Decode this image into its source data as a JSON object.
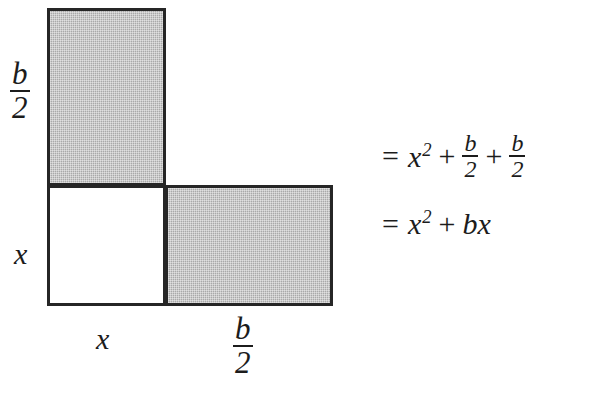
{
  "figure": {
    "shading_color": "#a9a9a9",
    "outline_color": "#262626",
    "background_color": "#ffffff",
    "regions": [
      {
        "name": "top-rectangle",
        "fill": "shaded",
        "width_label": "x",
        "height_label": "b/2"
      },
      {
        "name": "bottom-left-square",
        "fill": "white",
        "width_label": "x",
        "height_label": "x"
      },
      {
        "name": "bottom-right-rectangle",
        "fill": "shaded",
        "width_label": "b/2",
        "height_label": "x"
      }
    ],
    "labels": {
      "left_top": {
        "numerator": "b",
        "denominator": "2"
      },
      "left_bottom": "x",
      "bottom_left": "x",
      "bottom_right": {
        "numerator": "b",
        "denominator": "2"
      }
    }
  },
  "equations": {
    "line1": {
      "equals": "=",
      "term1_base": "x",
      "term1_exp": "2",
      "plus1": "+",
      "frac1_num": "b",
      "frac1_den": "2",
      "plus2": "+",
      "frac2_num": "b",
      "frac2_den": "2",
      "plain": "= x^2 + b/2 + b/2"
    },
    "line2": {
      "equals": "=",
      "term1_base": "x",
      "term1_exp": "2",
      "plus1": "+",
      "term2": "bx",
      "plain": "= x^2 + bx"
    }
  }
}
